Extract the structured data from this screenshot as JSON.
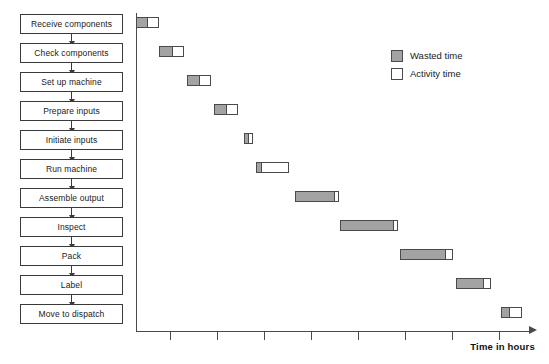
{
  "top_caption": "",
  "flowchart": {
    "nodes": [
      {
        "label": "Receive components"
      },
      {
        "label": "Check components"
      },
      {
        "label": "Set up machine"
      },
      {
        "label": "Prepare inputs"
      },
      {
        "label": "Initiate inputs"
      },
      {
        "label": "Run machine"
      },
      {
        "label": "Assemble output"
      },
      {
        "label": "Inspect"
      },
      {
        "label": "Pack"
      },
      {
        "label": "Label"
      },
      {
        "label": "Move to dispatch"
      }
    ]
  },
  "legend": {
    "position": "top-right",
    "items": [
      {
        "label": "Wasted time",
        "color": "#a3a3a3"
      },
      {
        "label": "Activity time",
        "color": "#ffffff"
      }
    ]
  },
  "axis": {
    "x_title": "Time in hours",
    "tick_labels": [],
    "tick_count": 8
  },
  "chart_data": {
    "type": "bar",
    "subtype": "gantt-stacked-horizontal",
    "title": "",
    "xlabel": "Time in hours",
    "ylabel": "",
    "xlim": [
      0,
      100
    ],
    "grid": false,
    "legend_position": "top-right",
    "categories": [
      "Receive components",
      "Check components",
      "Set up machine",
      "Prepare inputs",
      "Initiate inputs",
      "Run machine",
      "Assemble output",
      "Inspect",
      "Pack",
      "Label",
      "Move to dispatch"
    ],
    "series": [
      {
        "name": "Wasted time",
        "color": "#a3a3a3",
        "values": [
          3,
          4,
          4,
          4,
          2,
          3,
          10,
          14,
          12,
          7,
          3
        ]
      },
      {
        "name": "Activity time",
        "color": "#ffffff",
        "values": [
          3,
          3,
          3,
          3,
          1,
          8,
          1,
          1,
          2,
          2,
          3
        ]
      }
    ],
    "bar_starts": [
      0,
      6,
      13,
      20,
      27,
      30,
      41,
      52,
      67,
      81,
      91
    ],
    "units": "hours"
  },
  "bars": [
    {
      "name": "Receive components",
      "left": 0,
      "wasted": 12,
      "activity": 12,
      "top": 4
    },
    {
      "name": "Check components",
      "left": 23,
      "wasted": 14,
      "activity": 12,
      "top": 33
    },
    {
      "name": "Set up machine",
      "left": 51,
      "wasted": 13,
      "activity": 12,
      "top": 62
    },
    {
      "name": "Prepare inputs",
      "left": 78,
      "wasted": 13,
      "activity": 12,
      "top": 91
    },
    {
      "name": "Initiate inputs",
      "left": 108,
      "wasted": 5,
      "activity": 5,
      "top": 120
    },
    {
      "name": "Run machine",
      "left": 120,
      "wasted": 6,
      "activity": 28,
      "top": 149
    },
    {
      "name": "Assemble output",
      "left": 159,
      "wasted": 40,
      "activity": 5,
      "top": 178
    },
    {
      "name": "Inspect",
      "left": 204,
      "wasted": 54,
      "activity": 5,
      "top": 207
    },
    {
      "name": "Pack",
      "left": 264,
      "wasted": 46,
      "activity": 8,
      "top": 236
    },
    {
      "name": "Label",
      "left": 320,
      "wasted": 28,
      "activity": 8,
      "top": 265
    },
    {
      "name": "Move to dispatch",
      "left": 365,
      "wasted": 9,
      "activity": 13,
      "top": 294
    }
  ],
  "ticks": [
    34,
    81,
    128,
    175,
    222,
    269,
    316,
    363
  ]
}
